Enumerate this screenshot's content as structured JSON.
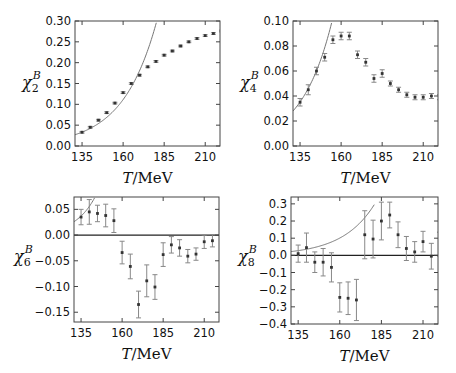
{
  "figure": {
    "panels_count": 4
  },
  "chart_data": [
    {
      "type": "scatter",
      "id": "chi2",
      "ylabel": {
        "symbol": "χ",
        "sub": "2",
        "sup": "B"
      },
      "xlabel": {
        "italic": "T",
        "rest": "/MeV"
      },
      "xlim": [
        130.7,
        219
      ],
      "ylim": [
        0.0,
        0.3
      ],
      "xticks": [
        135,
        160,
        185,
        210
      ],
      "yticks": [
        0.0,
        0.05,
        0.1,
        0.15,
        0.2,
        0.25,
        0.3
      ],
      "ytick_labels": [
        "0.00",
        "0.05",
        "0.10",
        "0.15",
        "0.20",
        "0.25",
        "0.30"
      ],
      "zero_line": false,
      "points": [
        {
          "x": 135,
          "y": 0.033,
          "err": 0.002
        },
        {
          "x": 140,
          "y": 0.045,
          "err": 0.002
        },
        {
          "x": 145,
          "y": 0.062,
          "err": 0.002
        },
        {
          "x": 150,
          "y": 0.08,
          "err": 0.002
        },
        {
          "x": 155,
          "y": 0.103,
          "err": 0.002
        },
        {
          "x": 160,
          "y": 0.128,
          "err": 0.002
        },
        {
          "x": 165,
          "y": 0.15,
          "err": 0.002
        },
        {
          "x": 170,
          "y": 0.17,
          "err": 0.002
        },
        {
          "x": 175,
          "y": 0.19,
          "err": 0.002
        },
        {
          "x": 180,
          "y": 0.203,
          "err": 0.002
        },
        {
          "x": 185,
          "y": 0.218,
          "err": 0.002
        },
        {
          "x": 190,
          "y": 0.228,
          "err": 0.002
        },
        {
          "x": 195,
          "y": 0.24,
          "err": 0.002
        },
        {
          "x": 200,
          "y": 0.25,
          "err": 0.002
        },
        {
          "x": 205,
          "y": 0.258,
          "err": 0.002
        },
        {
          "x": 210,
          "y": 0.265,
          "err": 0.002
        },
        {
          "x": 215,
          "y": 0.27,
          "err": 0.002
        },
        {
          "x": 220,
          "y": 0.276,
          "err": 0.002
        }
      ],
      "curve": {
        "name": "HRG",
        "x_start": 130.7,
        "y_start": 0.027,
        "x_end": 180.5,
        "y_end": 0.3
      }
    },
    {
      "type": "scatter",
      "id": "chi4",
      "ylabel": {
        "symbol": "χ",
        "sub": "4",
        "sup": "B"
      },
      "xlabel": {
        "italic": "T",
        "rest": "/MeV"
      },
      "xlim": [
        130.7,
        219
      ],
      "ylim": [
        0.0,
        0.1
      ],
      "xticks": [
        135,
        160,
        185,
        210
      ],
      "yticks": [
        0.0,
        0.02,
        0.04,
        0.06,
        0.08,
        0.1
      ],
      "ytick_labels": [
        "0.00",
        "0.02",
        "0.04",
        "0.06",
        "0.08",
        "0.10"
      ],
      "zero_line": false,
      "points": [
        {
          "x": 135,
          "y": 0.035,
          "err": 0.003
        },
        {
          "x": 140,
          "y": 0.045,
          "err": 0.004
        },
        {
          "x": 145,
          "y": 0.06,
          "err": 0.003
        },
        {
          "x": 150,
          "y": 0.071,
          "err": 0.003
        },
        {
          "x": 155,
          "y": 0.085,
          "err": 0.003
        },
        {
          "x": 160,
          "y": 0.088,
          "err": 0.003
        },
        {
          "x": 165,
          "y": 0.088,
          "err": 0.003
        },
        {
          "x": 170,
          "y": 0.073,
          "err": 0.003
        },
        {
          "x": 175,
          "y": 0.067,
          "err": 0.003
        },
        {
          "x": 180,
          "y": 0.054,
          "err": 0.003
        },
        {
          "x": 185,
          "y": 0.058,
          "err": 0.003
        },
        {
          "x": 190,
          "y": 0.05,
          "err": 0.002
        },
        {
          "x": 195,
          "y": 0.045,
          "err": 0.002
        },
        {
          "x": 200,
          "y": 0.041,
          "err": 0.002
        },
        {
          "x": 205,
          "y": 0.039,
          "err": 0.002
        },
        {
          "x": 210,
          "y": 0.039,
          "err": 0.002
        },
        {
          "x": 215,
          "y": 0.04,
          "err": 0.002
        },
        {
          "x": 220,
          "y": 0.039,
          "err": 0.002
        }
      ],
      "curve": {
        "name": "HRG",
        "x_start": 130.7,
        "y_start": 0.028,
        "x_end": 154.5,
        "y_end": 0.1
      }
    },
    {
      "type": "scatter",
      "id": "chi6",
      "ylabel": {
        "symbol": "χ",
        "sub": "6",
        "sup": "B"
      },
      "xlabel": {
        "italic": "T",
        "rest": "/MeV"
      },
      "xlim": [
        130.7,
        219
      ],
      "ylim": [
        -0.169,
        0.074
      ],
      "xticks": [
        135,
        160,
        185,
        210
      ],
      "yticks": [
        -0.15,
        -0.1,
        -0.05,
        0.0,
        0.05
      ],
      "ytick_labels": [
        "−0.15",
        "−0.10",
        "−0.05",
        "0.00",
        "0.05"
      ],
      "zero_line": true,
      "points": [
        {
          "x": 135,
          "y": 0.035,
          "err": 0.015
        },
        {
          "x": 140,
          "y": 0.045,
          "err": 0.024
        },
        {
          "x": 145,
          "y": 0.042,
          "err": 0.016
        },
        {
          "x": 150,
          "y": 0.038,
          "err": 0.022
        },
        {
          "x": 155,
          "y": 0.028,
          "err": 0.023
        },
        {
          "x": 160,
          "y": -0.034,
          "err": 0.022
        },
        {
          "x": 165,
          "y": -0.061,
          "err": 0.024
        },
        {
          "x": 170,
          "y": -0.135,
          "err": 0.026
        },
        {
          "x": 175,
          "y": -0.089,
          "err": 0.031
        },
        {
          "x": 180,
          "y": -0.101,
          "err": 0.024
        },
        {
          "x": 185,
          "y": -0.038,
          "err": 0.023
        },
        {
          "x": 190,
          "y": -0.019,
          "err": 0.016
        },
        {
          "x": 195,
          "y": -0.025,
          "err": 0.016
        },
        {
          "x": 200,
          "y": -0.041,
          "err": 0.013
        },
        {
          "x": 205,
          "y": -0.037,
          "err": 0.012
        },
        {
          "x": 210,
          "y": -0.013,
          "err": 0.013
        },
        {
          "x": 215,
          "y": -0.011,
          "err": 0.012
        }
      ],
      "curve": {
        "name": "HRG",
        "x_start": 130.7,
        "y_start": 0.026,
        "x_end": 143.5,
        "y_end": 0.074
      }
    },
    {
      "type": "scatter",
      "id": "chi8",
      "ylabel": {
        "symbol": "χ",
        "sub": "8",
        "sup": "B"
      },
      "xlabel": {
        "italic": "T",
        "rest": "/MeV"
      },
      "xlim": [
        130.7,
        219
      ],
      "ylim": [
        -0.4,
        0.34
      ],
      "xticks": [
        135,
        160,
        185,
        210
      ],
      "yticks": [
        -0.4,
        -0.3,
        -0.2,
        -0.1,
        0.0,
        0.1,
        0.2,
        0.3
      ],
      "ytick_labels": [
        "−0.4",
        "−0.3",
        "−0.2",
        "−0.1",
        "0.0",
        "0.1",
        "0.2",
        "0.3"
      ],
      "zero_line": true,
      "points": [
        {
          "x": 135,
          "y": 0.01,
          "err": 0.05
        },
        {
          "x": 140,
          "y": 0.045,
          "err": 0.085
        },
        {
          "x": 145,
          "y": -0.04,
          "err": 0.06
        },
        {
          "x": 150,
          "y": -0.04,
          "err": 0.08
        },
        {
          "x": 155,
          "y": -0.07,
          "err": 0.085
        },
        {
          "x": 160,
          "y": -0.245,
          "err": 0.085
        },
        {
          "x": 165,
          "y": -0.25,
          "err": 0.095
        },
        {
          "x": 170,
          "y": -0.26,
          "err": 0.12
        },
        {
          "x": 175,
          "y": 0.12,
          "err": 0.14
        },
        {
          "x": 180,
          "y": 0.095,
          "err": 0.11
        },
        {
          "x": 185,
          "y": 0.2,
          "err": 0.11
        },
        {
          "x": 190,
          "y": 0.235,
          "err": 0.075
        },
        {
          "x": 195,
          "y": 0.12,
          "err": 0.075
        },
        {
          "x": 200,
          "y": 0.04,
          "err": 0.07
        },
        {
          "x": 205,
          "y": 0.02,
          "err": 0.06
        },
        {
          "x": 210,
          "y": 0.08,
          "err": 0.06
        },
        {
          "x": 215,
          "y": -0.005,
          "err": 0.075
        },
        {
          "x": 220,
          "y": 0.065,
          "err": 0.07
        }
      ],
      "curve": {
        "name": "HRG",
        "x_start": 130.7,
        "y_start": 0.022,
        "x_end": 181,
        "y_end": 0.3
      }
    }
  ]
}
